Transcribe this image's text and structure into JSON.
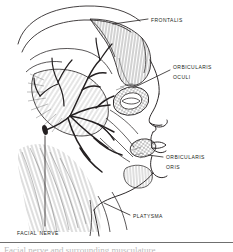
{
  "figure": {
    "background_color": "#ffffff",
    "ink_color": "#231f20",
    "width": 233,
    "height": 252
  },
  "labels": {
    "frontalis": {
      "text": "Frontalis"
    },
    "orbicularis_oculi": {
      "line1": "Orbicularis",
      "line2": "Oculi"
    },
    "orbicularis_oris": {
      "line1": "Orbicularis",
      "line2": "Oris"
    },
    "platysma": {
      "text": "Platysma"
    },
    "facial_nerve": {
      "text": "Facial Nerve"
    }
  },
  "caption": {
    "text": "Facial nerve and surrounding musculature"
  }
}
